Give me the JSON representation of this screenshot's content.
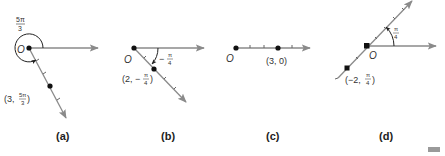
{
  "colors": {
    "ray": "#8a8a8a",
    "point": "#111111",
    "text": "#333333",
    "badge": "#9a9a9a"
  },
  "panels": [
    {
      "id": "a",
      "caption": "(a)",
      "pole_label": "O",
      "angle_label": {
        "num": "5π",
        "den": "3"
      },
      "point_label": {
        "prefix": "(3, ",
        "num": "5π",
        "den": "3",
        "suffix": ")"
      },
      "point": {
        "r": 3,
        "theta": "5π/3"
      }
    },
    {
      "id": "b",
      "caption": "(b)",
      "pole_label": "O",
      "angle_label": {
        "sign": "−",
        "num": "π",
        "den": "4"
      },
      "point_label": {
        "prefix": "(2, −",
        "num": "π",
        "den": "4",
        "suffix": ")"
      },
      "point": {
        "r": 2,
        "theta": "-π/4"
      }
    },
    {
      "id": "c",
      "caption": "(c)",
      "pole_label": "O",
      "point_label": {
        "text": "(3, 0)"
      },
      "point": {
        "r": 3,
        "theta": "0"
      }
    },
    {
      "id": "d",
      "caption": "(d)",
      "pole_label": "O",
      "angle_label": {
        "num": "π",
        "den": "4"
      },
      "point_label": {
        "prefix": "(−2, ",
        "num": "π",
        "den": "4",
        "suffix": ")"
      },
      "point": {
        "r": -2,
        "theta": "π/4"
      }
    }
  ]
}
